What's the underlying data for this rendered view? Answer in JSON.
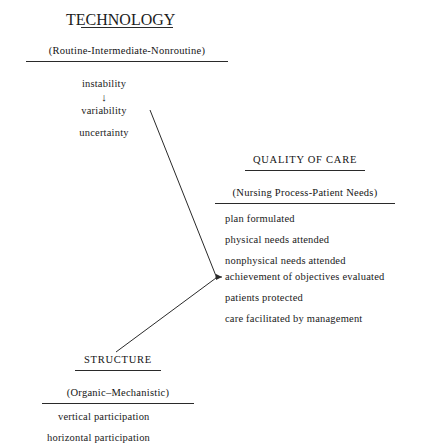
{
  "diagram": {
    "type": "conceptual-flow-diagram",
    "background_color": "#ffffff",
    "text_color": "#1a1a1a",
    "line_color": "#2a2a2a",
    "blocks": [
      {
        "id": "technology",
        "title": "TECHNOLOGY",
        "subtitle": "(Routine-Intermediate-Nonroutine)",
        "items": [
          "instability",
          "variability",
          "uncertainty"
        ],
        "arrow_between_items": "↓"
      },
      {
        "id": "quality-of-care",
        "title": "QUALITY OF CARE",
        "subtitle": "(Nursing Process-Patient Needs)",
        "items": [
          "plan formulated",
          "physical needs attended",
          "nonphysical needs attended",
          "achievement of objectives evaluated",
          "patients protected",
          "care facilitated by management"
        ]
      },
      {
        "id": "structure",
        "title": "STRUCTURE",
        "subtitle": "(Organic–Mechanistic)",
        "items": [
          "vertical participation",
          "horizontal participation"
        ]
      }
    ],
    "connectors": [
      {
        "id": "technology-to-quality",
        "from": "technology",
        "to": "quality-of-care",
        "target_item": "achievement of objectives evaluated",
        "style": "diagonal-line-with-arrowhead"
      },
      {
        "id": "structure-to-quality",
        "from": "structure",
        "to": "quality-of-care",
        "target_item": "achievement of objectives evaluated",
        "style": "diagonal-line-with-arrowhead"
      }
    ]
  }
}
